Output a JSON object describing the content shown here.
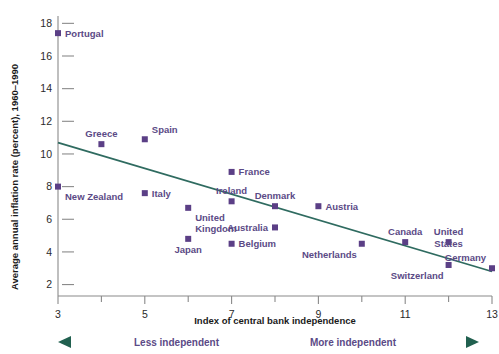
{
  "chart_data": {
    "type": "scatter",
    "title": "",
    "xlabel": "Index of central bank independence",
    "ylabel": "Average annual inflation rate (percent), 1960–1990",
    "xlim": [
      3,
      13
    ],
    "ylim": [
      1.3,
      18
    ],
    "xticks": [
      3,
      5,
      7,
      9,
      11,
      13
    ],
    "xtick_labels": [
      "3",
      "5",
      "7",
      "9",
      "11",
      "13"
    ],
    "xminor_ticks": [
      4,
      6,
      8,
      10,
      12
    ],
    "yticks": [
      2,
      4,
      6,
      8,
      10,
      12,
      14,
      16,
      18
    ],
    "ytick_labels": [
      "2",
      "4",
      "6",
      "8",
      "10",
      "12",
      "14",
      "16",
      "18"
    ],
    "grid": false,
    "legend": null,
    "marker_color": "#5b3f86",
    "label_color": "#5b4a86",
    "trendline_color": "#2f6b60",
    "points": [
      {
        "name": "Portugal",
        "x": 3,
        "y": 17.4,
        "label_pos": "right"
      },
      {
        "name": "New Zealand",
        "x": 3,
        "y": 8.0,
        "label_pos": "below-right"
      },
      {
        "name": "Greece",
        "x": 4,
        "y": 10.6,
        "label_pos": "above"
      },
      {
        "name": "Spain",
        "x": 5,
        "y": 10.9,
        "label_pos": "above-right"
      },
      {
        "name": "Italy",
        "x": 5,
        "y": 7.6,
        "label_pos": "right"
      },
      {
        "name": "United Kingdom",
        "x": 6,
        "y": 6.7,
        "label_pos": "below-right"
      },
      {
        "name": "Japan",
        "x": 6,
        "y": 4.8,
        "label_pos": "below"
      },
      {
        "name": "France",
        "x": 7,
        "y": 8.9,
        "label_pos": "right"
      },
      {
        "name": "Ireland",
        "x": 7,
        "y": 7.1,
        "label_pos": "above"
      },
      {
        "name": "Belgium",
        "x": 7,
        "y": 4.5,
        "label_pos": "right"
      },
      {
        "name": "Denmark",
        "x": 8,
        "y": 6.8,
        "label_pos": "above"
      },
      {
        "name": "Australia",
        "x": 8,
        "y": 5.5,
        "label_pos": "left"
      },
      {
        "name": "Austria",
        "x": 9,
        "y": 6.8,
        "label_pos": "right"
      },
      {
        "name": "Netherlands",
        "x": 10,
        "y": 4.5,
        "label_pos": "below-left"
      },
      {
        "name": "Canada",
        "x": 11,
        "y": 4.6,
        "label_pos": "above"
      },
      {
        "name": "United States",
        "x": 12,
        "y": 4.6,
        "label_pos": "above"
      },
      {
        "name": "Switzerland",
        "x": 12,
        "y": 3.2,
        "label_pos": "below-left"
      },
      {
        "name": "Germany",
        "x": 13,
        "y": 3.0,
        "label_pos": "above-left"
      }
    ],
    "trendline": {
      "x_start": 3,
      "y_start": 10.7,
      "x_end": 13,
      "y_end": 2.8
    },
    "annotations": {
      "left_direction": "Less independent",
      "right_direction": "More independent"
    }
  }
}
